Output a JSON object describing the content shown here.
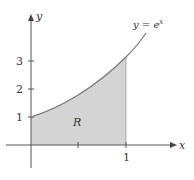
{
  "figure": {
    "curve_label": "y = e",
    "curve_label_exp": "x",
    "x_axis_label": "x",
    "y_axis_label": "y",
    "region_label": "R",
    "y_ticks": [
      "1",
      "2",
      "3"
    ],
    "x_ticks": [
      "1"
    ],
    "colors": {
      "axis": "#555555",
      "curve": "#777777",
      "fill": "#d4d4d4",
      "text": "#333333"
    }
  }
}
